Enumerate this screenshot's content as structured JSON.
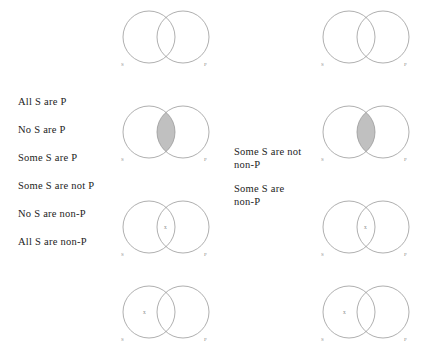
{
  "figure": {
    "background": "#ffffff",
    "circle_stroke": "#9b9b9b",
    "shade_fill": "#c0c0c0",
    "label_color": "#8d8d8d",
    "text_color": "#1c1c1c"
  },
  "left_propositions": [
    {
      "text": "All S are P"
    },
    {
      "text": "No S are P"
    },
    {
      "text": "Some S are P"
    },
    {
      "text": "Some S are not P"
    },
    {
      "text": "No S are non-P"
    },
    {
      "text": "All S are non-P"
    }
  ],
  "right_propositions": [
    {
      "text": "Some S are not\nnon-P"
    },
    {
      "text": "Some S are\nnon-P"
    }
  ],
  "diagrams": {
    "left": [
      {
        "s_label": "S",
        "p_label": "P",
        "shading": "s-only",
        "mark": "",
        "mark_region": ""
      },
      {
        "s_label": "S",
        "p_label": "P",
        "shading": "intersection",
        "mark": "",
        "mark_region": ""
      },
      {
        "s_label": "S",
        "p_label": "P",
        "shading": "none",
        "mark": "x",
        "mark_region": "intersection"
      },
      {
        "s_label": "S",
        "p_label": "P",
        "shading": "none",
        "mark": "x",
        "mark_region": "s-only"
      }
    ],
    "right": [
      {
        "s_label": "S",
        "p_label": "P",
        "shading": "s-only",
        "mark": "",
        "mark_region": ""
      },
      {
        "s_label": "S",
        "p_label": "P",
        "shading": "intersection",
        "mark": "",
        "mark_region": ""
      },
      {
        "s_label": "S",
        "p_label": "P",
        "shading": "none",
        "mark": "x",
        "mark_region": "intersection"
      },
      {
        "s_label": "S",
        "p_label": "P",
        "shading": "none",
        "mark": "x",
        "mark_region": "s-only"
      }
    ]
  }
}
